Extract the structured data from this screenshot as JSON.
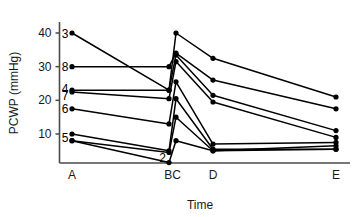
{
  "chart_data": {
    "type": "line",
    "title": "",
    "xlabel": "Time",
    "ylabel": "PCWP (mmHg)",
    "x_categories": [
      "A",
      "B",
      "C",
      "D",
      "E"
    ],
    "x_tick_labels": [
      "A",
      "BC",
      "D",
      "E"
    ],
    "y_ticks": [
      10,
      20,
      30,
      40
    ],
    "ylim": [
      0,
      43
    ],
    "grid": false,
    "legend": "inline-series-labels-at-left",
    "series": [
      {
        "name": "3",
        "label_value": "3",
        "values": [
          40.0,
          23.0,
          40.0,
          32.5,
          21.0
        ]
      },
      {
        "name": "8",
        "label_value": "8",
        "values": [
          30.0,
          30.0,
          34.0,
          26.0,
          17.5
        ]
      },
      {
        "name": "4",
        "label_value": "4",
        "values": [
          23.0,
          23.0,
          33.5,
          21.5,
          11.0
        ]
      },
      {
        "name": "7",
        "label_value": "7",
        "values": [
          22.5,
          20.5,
          31.5,
          19.5,
          9.0
        ]
      },
      {
        "name": "6",
        "label_value": "6",
        "values": [
          17.5,
          13.0,
          25.5,
          7.0,
          7.5
        ]
      },
      {
        "name": "5",
        "label_value": "5",
        "values": [
          10.0,
          5.0,
          20.5,
          5.5,
          5.5
        ]
      },
      {
        "name": "u1",
        "label_value": "",
        "values": [
          8.0,
          4.5,
          15.0,
          5.0,
          6.5
        ]
      },
      {
        "name": "2",
        "label_value": "2",
        "values": [
          8.0,
          1.5,
          8.0,
          5.0,
          5.5
        ]
      }
    ],
    "series_labels_left": [
      "3",
      "8",
      "4",
      "7",
      "6",
      "5"
    ],
    "series_label_inline": [
      "2"
    ],
    "colors": {
      "line": "#000000",
      "marker": "#000000",
      "axis": "#4a4a4a",
      "text": "#1a1a1a"
    }
  }
}
